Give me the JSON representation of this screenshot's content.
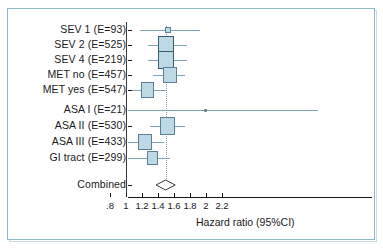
{
  "chart_data": {
    "type": "scatter",
    "subtype": "forest-plot",
    "title": "",
    "xlabel": "Hazard ratio  (95%CI)",
    "ylabel": "",
    "xscale": "linear",
    "xlim": [
      0.8,
      2.2
    ],
    "xticks": [
      0.8,
      1.0,
      1.2,
      1.4,
      1.6,
      1.8,
      2.0,
      2.2
    ],
    "xticklabels": [
      ".8",
      "1",
      "1.2",
      "1.4",
      "1.6",
      "1.8",
      "2",
      "2.2"
    ],
    "grid": false,
    "legend": null,
    "reference_line": 1.0,
    "pooled_line": 1.5,
    "categories": [
      "SEV 1  (E=93)",
      "SEV 2  (E=525)",
      "SEV 4  (E=219)",
      "MET no  (E=457)",
      "MET yes  (E=547)",
      "ASA I  (E=21)",
      "ASA II  (E=530)",
      "ASA III  (E=433)",
      "GI tract  (E=299)",
      "Combined"
    ],
    "rows": [
      {
        "label": "SEV 1  (E=93)",
        "group": "SEV",
        "events": 93,
        "estimate": 1.52,
        "ci_low": 1.17,
        "ci_high": 1.92,
        "weight": 0.1,
        "marker": "small-square"
      },
      {
        "label": "SEV 2  (E=525)",
        "group": "SEV",
        "events": 525,
        "estimate": 1.5,
        "ci_low": 1.28,
        "ci_high": 1.76,
        "weight": 0.55,
        "marker": "box"
      },
      {
        "label": "SEV 4  (E=219)",
        "group": "SEV",
        "events": 219,
        "estimate": 1.5,
        "ci_low": 1.28,
        "ci_high": 1.76,
        "weight": 0.55,
        "marker": "box"
      },
      {
        "label": "MET no  (E=457)",
        "group": "MET",
        "events": 457,
        "estimate": 1.55,
        "ci_low": 1.34,
        "ci_high": 1.74,
        "weight": 0.36,
        "marker": "box"
      },
      {
        "label": "MET yes  (E=547)",
        "group": "MET",
        "events": 547,
        "estimate": 1.27,
        "ci_low": 1.08,
        "ci_high": 1.5,
        "weight": 0.4,
        "marker": "box"
      },
      {
        "label": "ASA I  (E=21)",
        "group": "ASA",
        "events": 21,
        "estimate": 1.99,
        "ci_low": 1.02,
        "ci_high": 3.4,
        "weight": 0.05,
        "marker": "point"
      },
      {
        "label": "ASA II  (E=530)",
        "group": "ASA",
        "events": 530,
        "estimate": 1.52,
        "ci_low": 1.3,
        "ci_high": 1.74,
        "weight": 0.48,
        "marker": "box"
      },
      {
        "label": "ASA III  (E=433)",
        "group": "ASA",
        "events": 433,
        "estimate": 1.24,
        "ci_low": 1.02,
        "ci_high": 1.47,
        "weight": 0.42,
        "marker": "box"
      },
      {
        "label": "GI tract  (E=299)",
        "group": "GI",
        "events": 299,
        "estimate": 1.33,
        "ci_low": 1.02,
        "ci_high": 1.55,
        "weight": 0.26,
        "marker": "box"
      }
    ],
    "combined": {
      "label": "Combined",
      "estimate": 1.5,
      "ci_low": 1.43,
      "ci_high": 1.57,
      "marker": "diamond"
    }
  }
}
